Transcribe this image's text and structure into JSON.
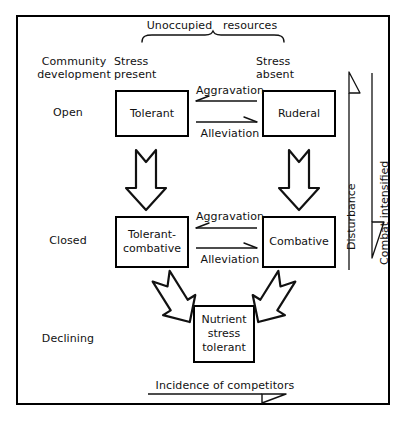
{
  "diagram": {
    "title_top": "Unoccupied   resources",
    "axis_bottom": "Incidence of competitors",
    "axis_right_inner": "Disturbance",
    "axis_right_outer": "Combat intensified",
    "row_header": "Community\ndevelopment",
    "column_headers": {
      "left": "Stress\npresent",
      "right": "Stress\nabsent"
    },
    "rows": [
      {
        "id": "open",
        "label": "Open"
      },
      {
        "id": "closed",
        "label": "Closed"
      },
      {
        "id": "declining",
        "label": "Declining"
      }
    ],
    "nodes": [
      {
        "id": "tolerant",
        "label": "Tolerant",
        "row": "open",
        "column": "left"
      },
      {
        "id": "ruderal",
        "label": "Ruderal",
        "row": "open",
        "column": "right"
      },
      {
        "id": "tolerant-combative",
        "label": "Tolerant-\ncombative",
        "row": "closed",
        "column": "left"
      },
      {
        "id": "combative",
        "label": "Combative",
        "row": "closed",
        "column": "right"
      },
      {
        "id": "nutrient-stress-tolerant",
        "label": "Nutrient\nstress\ntolerant",
        "row": "declining",
        "column": "center"
      }
    ],
    "transitions": [
      {
        "id": "open-aggravation",
        "label": "Aggravation",
        "row": "open",
        "direction": "right-to-left"
      },
      {
        "id": "open-alleviation",
        "label": "Alleviation",
        "row": "open",
        "direction": "left-to-right"
      },
      {
        "id": "closed-aggravation",
        "label": "Aggravation",
        "row": "closed",
        "direction": "right-to-left"
      },
      {
        "id": "closed-alleviation",
        "label": "Alleviation",
        "row": "closed",
        "direction": "left-to-right"
      }
    ],
    "block_arrows": [
      {
        "id": "tolerant-to-tolerant-combative",
        "direction": "down"
      },
      {
        "id": "ruderal-to-combative",
        "direction": "down"
      },
      {
        "id": "tolerant-combative-to-nutrient",
        "direction": "down-right"
      },
      {
        "id": "combative-to-nutrient",
        "direction": "down-left"
      }
    ],
    "colors": {
      "ink": "#111111",
      "frame": "#000000",
      "background": "#ffffff"
    }
  }
}
